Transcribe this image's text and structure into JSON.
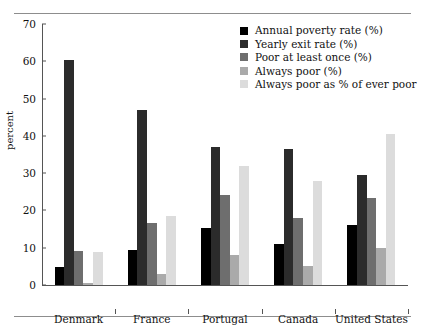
{
  "chart_data": {
    "type": "bar",
    "title": "",
    "xlabel": "",
    "ylabel": "percent",
    "ylim": [
      0,
      70
    ],
    "yticks": [
      0,
      10,
      20,
      30,
      40,
      50,
      60,
      70
    ],
    "grid": false,
    "legend_position": "top-right",
    "categories": [
      "Denmark",
      "France",
      "Portugal",
      "Canada",
      "United States"
    ],
    "series": [
      {
        "name": "Annual poverty rate (%)",
        "color": "#000000",
        "values": [
          4.8,
          9.5,
          15.2,
          10.9,
          16.0
        ]
      },
      {
        "name": "Yearly exit rate (%)",
        "color": "#2b2b2b",
        "values": [
          60.3,
          47.0,
          37.0,
          36.5,
          29.5
        ]
      },
      {
        "name": "Poor at least once (%)",
        "color": "#6e6e6e",
        "values": [
          9.2,
          16.5,
          24.1,
          18.0,
          23.4
        ]
      },
      {
        "name": "Always poor (%)",
        "color": "#aaaaaa",
        "values": [
          0.6,
          3.0,
          8.0,
          5.0,
          9.9
        ]
      },
      {
        "name": "Always poor as % of ever poor",
        "color": "#dcdcdc",
        "values": [
          8.8,
          18.4,
          32.0,
          28.0,
          40.5
        ]
      }
    ]
  }
}
